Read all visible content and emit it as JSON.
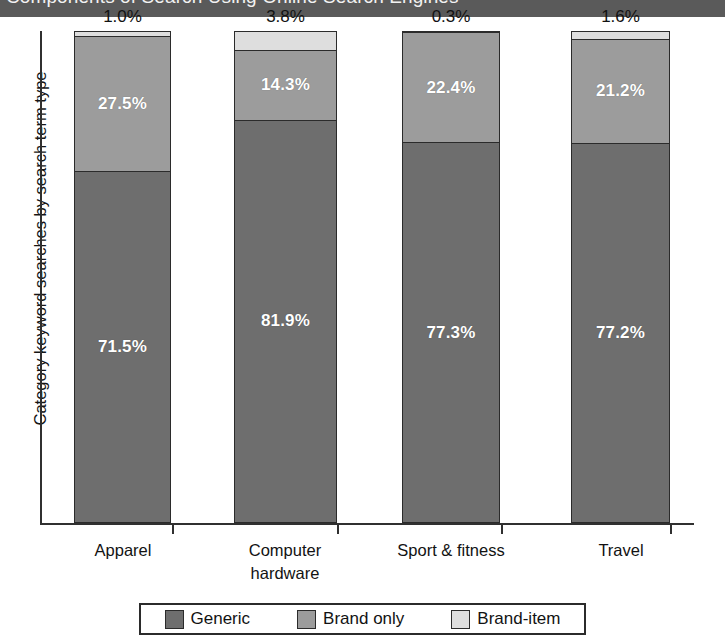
{
  "title": "Components of Search Using Online Search Engines",
  "chart_data": {
    "type": "bar",
    "subtype": "stacked-column-100",
    "title": "Components of Search Using Online Search Engines",
    "xlabel": "",
    "ylabel": "Category keyword searches by search term type",
    "ylim": [
      0,
      100
    ],
    "grid": false,
    "legend_position": "bottom",
    "categories": [
      "Apparel",
      "Computer hardware",
      "Sport & fitness",
      "Travel"
    ],
    "category_lines": [
      [
        "Apparel"
      ],
      [
        "Computer",
        "hardware"
      ],
      [
        "Sport & fitness"
      ],
      [
        "Travel"
      ]
    ],
    "series": [
      {
        "name": "Generic",
        "color": "#6e6e6e",
        "values": [
          71.5,
          81.9,
          77.3,
          77.2
        ],
        "labels": [
          "71.5%",
          "81.9%",
          "77.3%",
          "77.2%"
        ]
      },
      {
        "name": "Brand only",
        "color": "#9c9c9c",
        "values": [
          27.5,
          14.3,
          22.4,
          21.2
        ],
        "labels": [
          "27.5%",
          "14.3%",
          "22.4%",
          "21.2%"
        ]
      },
      {
        "name": "Brand-item",
        "color": "#dedede",
        "values": [
          1.0,
          3.8,
          0.3,
          1.6
        ],
        "labels": [
          "1.0%",
          "3.8%",
          "0.3%",
          "1.6%"
        ]
      }
    ],
    "top_labels": [
      "1.0%",
      "3.8%",
      "0.3%",
      "1.6%"
    ]
  },
  "legend": {
    "items": [
      {
        "label": "Generic",
        "color": "#6e6e6e"
      },
      {
        "label": "Brand only",
        "color": "#9c9c9c"
      },
      {
        "label": "Brand-item",
        "color": "#dedede"
      }
    ]
  },
  "colors": {
    "title_bar": "#5a5a5a",
    "axis": "#303030",
    "generic": "#6e6e6e",
    "brand_only": "#9c9c9c",
    "brand_item": "#dedede"
  }
}
